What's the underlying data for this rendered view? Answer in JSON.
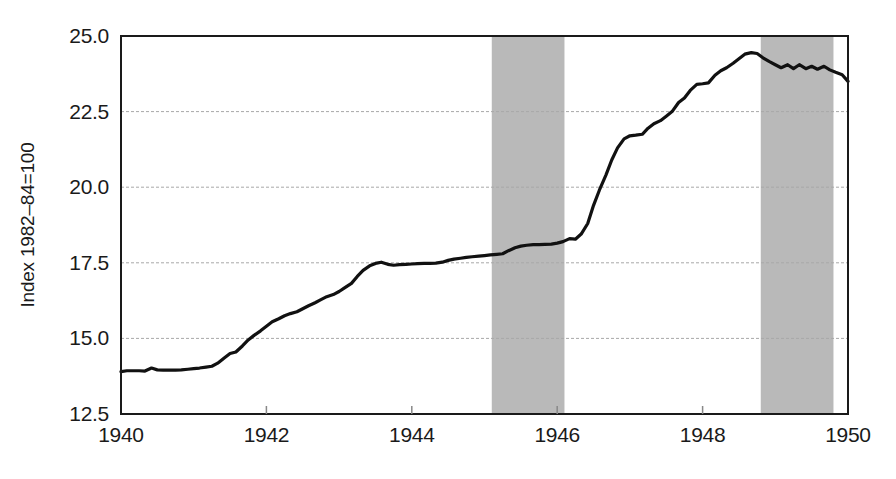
{
  "chart_data": {
    "type": "line",
    "title": "",
    "subtitle": "",
    "xlabel": "",
    "ylabel": "Index 1982–84=100",
    "xlim": [
      1940,
      1950
    ],
    "ylim": [
      12.5,
      25.0
    ],
    "grid": true,
    "legend": null,
    "xticks": [
      1940,
      1942,
      1944,
      1946,
      1948,
      1950
    ],
    "xtick_labels": [
      "1940",
      "1942",
      "1944",
      "1946",
      "1948",
      "1950"
    ],
    "yticks": [
      12.5,
      15.0,
      17.5,
      20.0,
      22.5,
      25.0
    ],
    "ytick_labels": [
      "12.5",
      "15.0",
      "17.5",
      "20.0",
      "22.5",
      "25.0"
    ],
    "gridline_values": [
      15.0,
      17.5,
      20.0,
      22.5
    ],
    "line_color": "#111111",
    "line_width": 3.2,
    "shaded_band_color": "#b9b9b9",
    "shaded_bands": [
      {
        "name": "recession-band-1",
        "start": 1945.1,
        "end": 1946.1
      },
      {
        "name": "recession-band-2",
        "start": 1948.8,
        "end": 1949.8
      }
    ],
    "series": [
      {
        "name": "Consumer Price Index",
        "x": [
          1940.0,
          1940.08,
          1940.17,
          1940.25,
          1940.33,
          1940.42,
          1940.5,
          1940.58,
          1940.67,
          1940.75,
          1940.83,
          1940.92,
          1941.0,
          1941.08,
          1941.17,
          1941.25,
          1941.33,
          1941.42,
          1941.5,
          1941.58,
          1941.67,
          1941.75,
          1941.83,
          1941.92,
          1942.0,
          1942.08,
          1942.17,
          1942.25,
          1942.33,
          1942.42,
          1942.5,
          1942.58,
          1942.67,
          1942.75,
          1942.83,
          1942.92,
          1943.0,
          1943.08,
          1943.17,
          1943.25,
          1943.33,
          1943.42,
          1943.5,
          1943.58,
          1943.67,
          1943.75,
          1943.83,
          1943.92,
          1944.0,
          1944.08,
          1944.17,
          1944.25,
          1944.33,
          1944.42,
          1944.5,
          1944.58,
          1944.67,
          1944.75,
          1944.83,
          1944.92,
          1945.0,
          1945.08,
          1945.17,
          1945.25,
          1945.33,
          1945.42,
          1945.5,
          1945.58,
          1945.67,
          1945.75,
          1945.83,
          1945.92,
          1946.0,
          1946.08,
          1946.17,
          1946.25,
          1946.33,
          1946.42,
          1946.5,
          1946.58,
          1946.67,
          1946.75,
          1946.83,
          1946.92,
          1947.0,
          1947.08,
          1947.17,
          1947.25,
          1947.33,
          1947.42,
          1947.5,
          1947.58,
          1947.67,
          1947.75,
          1947.83,
          1947.92,
          1948.0,
          1948.08,
          1948.17,
          1948.25,
          1948.33,
          1948.42,
          1948.5,
          1948.58,
          1948.67,
          1948.75,
          1948.83,
          1948.92,
          1949.0,
          1949.08,
          1949.17,
          1949.25,
          1949.33,
          1949.42,
          1949.5,
          1949.58,
          1949.67,
          1949.75,
          1949.83,
          1949.92,
          1950.0
        ],
        "y": [
          13.9,
          13.93,
          13.93,
          13.93,
          13.92,
          14.02,
          13.96,
          13.95,
          13.95,
          13.95,
          13.96,
          13.98,
          14.0,
          14.02,
          14.05,
          14.08,
          14.18,
          14.35,
          14.5,
          14.55,
          14.75,
          14.95,
          15.1,
          15.25,
          15.4,
          15.55,
          15.65,
          15.75,
          15.82,
          15.88,
          15.98,
          16.08,
          16.18,
          16.28,
          16.38,
          16.45,
          16.55,
          16.68,
          16.82,
          17.05,
          17.25,
          17.4,
          17.48,
          17.52,
          17.45,
          17.42,
          17.44,
          17.45,
          17.46,
          17.47,
          17.48,
          17.48,
          17.49,
          17.52,
          17.58,
          17.62,
          17.65,
          17.68,
          17.7,
          17.72,
          17.74,
          17.76,
          17.78,
          17.8,
          17.9,
          18.0,
          18.05,
          18.08,
          18.1,
          18.1,
          18.11,
          18.12,
          18.15,
          18.2,
          18.3,
          18.28,
          18.45,
          18.8,
          19.4,
          19.9,
          20.4,
          20.9,
          21.3,
          21.6,
          21.7,
          21.72,
          21.75,
          21.95,
          22.1,
          22.2,
          22.35,
          22.5,
          22.8,
          22.95,
          23.2,
          23.4,
          23.42,
          23.45,
          23.7,
          23.85,
          23.95,
          24.1,
          24.25,
          24.4,
          24.45,
          24.42,
          24.28,
          24.15,
          24.05,
          23.95,
          24.05,
          23.92,
          24.05,
          23.92,
          24.0,
          23.9,
          24.0,
          23.88,
          23.8,
          23.72,
          23.5
        ]
      }
    ]
  },
  "axis": {
    "ylabel": "Index 1982–84=100"
  }
}
